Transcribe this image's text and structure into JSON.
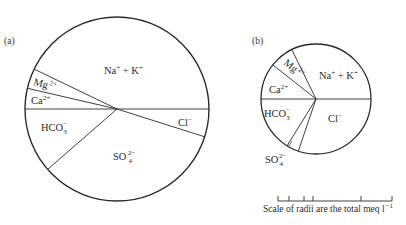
{
  "chart_data": [
    {
      "type": "pie",
      "panel_label": "(a)",
      "center": [
        117,
        109
      ],
      "radius": 92,
      "boundaries_deg": [
        0,
        17.6,
        139,
        180,
        193,
        205.7
      ],
      "slices": [
        {
          "name": "Cl⁻",
          "ion": "Cl",
          "charge": "−",
          "start_deg": 0,
          "end_deg": 17.6,
          "approx_percent": 4.9
        },
        {
          "name": "SO₄²⁻",
          "ion": "SO",
          "sub": "4",
          "charge": "2−",
          "start_deg": 17.6,
          "end_deg": 139,
          "approx_percent": 33.7
        },
        {
          "name": "HCO₃⁻",
          "ion": "HCO",
          "sub": "3",
          "charge": "−",
          "start_deg": 139,
          "end_deg": 180,
          "approx_percent": 11.4
        },
        {
          "name": "Ca²⁺",
          "ion": "Ca",
          "charge": "2+",
          "start_deg": 180,
          "end_deg": 193,
          "approx_percent": 3.6
        },
        {
          "name": "Mg²⁺",
          "ion": "Mg",
          "charge": "2+",
          "start_deg": 193,
          "end_deg": 205.7,
          "approx_percent": 3.5
        },
        {
          "name": "Na⁺ + K⁺",
          "ion": "Na",
          "charge": "+",
          "start_deg": 205.7,
          "end_deg": 360,
          "approx_percent": 42.9
        }
      ]
    },
    {
      "type": "pie",
      "panel_label": "(b)",
      "center": [
        316,
        99
      ],
      "radius": 55,
      "boundaries_deg": [
        0,
        108.8,
        121.7,
        180,
        218.3,
        243.9
      ],
      "slices": [
        {
          "name": "Cl⁻",
          "start_deg": 0,
          "end_deg": 108.8,
          "approx_percent": 30.2
        },
        {
          "name": "SO₄²⁻",
          "start_deg": 108.8,
          "end_deg": 121.7,
          "approx_percent": 3.6
        },
        {
          "name": "HCO₃⁻",
          "start_deg": 121.7,
          "end_deg": 180,
          "approx_percent": 16.2
        },
        {
          "name": "Ca²⁺",
          "start_deg": 180,
          "end_deg": 218.3,
          "approx_percent": 10.6
        },
        {
          "name": "Mg²⁺",
          "start_deg": 218.3,
          "end_deg": 243.9,
          "approx_percent": 7.1
        },
        {
          "name": "Na⁺ + K⁺",
          "start_deg": 243.9,
          "end_deg": 360,
          "approx_percent": 32.3
        }
      ]
    }
  ],
  "labels": {
    "panel_a": "(a)",
    "panel_b": "(b)",
    "na": "Na",
    "plus": "+",
    "plus_k": " + K",
    "mg": "Mg",
    "ca": "Ca",
    "two_plus": "2+",
    "hco": "HCO",
    "three": "3",
    "minus": "−",
    "cl": "Cl",
    "so": "SO",
    "four": "4",
    "two_minus": "2−"
  },
  "scale": {
    "caption": "Scale of radii are the total meq l",
    "caption_exp": "−1",
    "bar_x": [
      278,
      392
    ],
    "ticks_x": [
      278,
      289,
      304,
      313,
      361,
      392
    ]
  }
}
